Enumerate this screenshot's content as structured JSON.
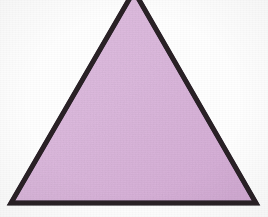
{
  "figure": {
    "shape_name": "triangle",
    "caption": "",
    "background_color": "#fefefe",
    "fill_color": "#dcb9dd",
    "fill_color_alt": "#d3abd4",
    "stroke_color": "#2a2028",
    "stroke_width_px": 5,
    "canvas": {
      "width": 268,
      "height": 217
    },
    "vertices": [
      {
        "name": "apex",
        "x": 134,
        "y": -9,
        "label": ""
      },
      {
        "name": "bottom-right",
        "x": 256,
        "y": 203,
        "label": ""
      },
      {
        "name": "bottom-left",
        "x": 11,
        "y": 203,
        "label": ""
      }
    ],
    "polygon_points": "134,-9 256,203 11,203",
    "notes": {
      "apex_cropped": "Apex extends above the top edge of the image and is cut off",
      "orientation": "point-up"
    }
  },
  "chart_data": {
    "type": "scatter",
    "xlabel": "",
    "ylabel": "",
    "x": [
      134,
      256,
      11
    ],
    "y": [
      -9,
      203,
      203
    ],
    "series": [
      {
        "name": "triangle-vertices",
        "values": [
          -9,
          203,
          203
        ]
      }
    ],
    "xlim": [
      0,
      268
    ],
    "ylim": [
      0,
      217
    ],
    "grid": false,
    "legend": "none"
  }
}
